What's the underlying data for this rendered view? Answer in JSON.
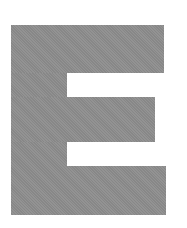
{
  "figure": {
    "letter": "E",
    "color": "#8d8d8d",
    "background": "#ffffff"
  }
}
